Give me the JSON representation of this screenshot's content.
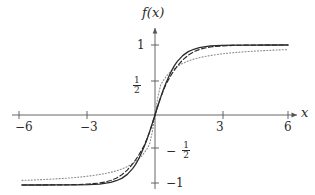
{
  "figure": {
    "kind": "math-function-plot",
    "background": "#ffffff",
    "ink_color": "#2b2b2b"
  },
  "labels": {
    "y_axis_name": "f(x)",
    "x_axis_name": "x",
    "x_ticks": [
      {
        "value": -6,
        "text": "−6"
      },
      {
        "value": -3,
        "text": "−3"
      },
      {
        "value": 3,
        "text": "3"
      },
      {
        "value": 6,
        "text": "6"
      }
    ],
    "y_ticks": [
      {
        "value": 1,
        "text": "1",
        "type": "integer"
      },
      {
        "value": 0.5,
        "text": "1/2",
        "type": "fraction",
        "num": "1",
        "den": "2",
        "sign": ""
      },
      {
        "value": -0.5,
        "text": "-1/2",
        "type": "fraction",
        "num": "1",
        "den": "2",
        "sign": "−"
      },
      {
        "value": -1,
        "text": "−1",
        "type": "integer"
      }
    ]
  },
  "chart_data": {
    "type": "line",
    "title": "",
    "subtitle": "",
    "xlabel": "x",
    "ylabel": "f(x)",
    "xlim": [
      -6.6,
      6.6
    ],
    "ylim": [
      -1.15,
      1.25
    ],
    "grid": false,
    "legend": "none",
    "axis_style": {
      "x_axis_at_y": 0,
      "y_axis_at_x": 0,
      "arrows": [
        "x-positive",
        "y-positive",
        "x-negative"
      ],
      "tick_marks": true
    },
    "x_tick_values": [
      -6,
      -3,
      3,
      6
    ],
    "y_tick_values": [
      -1,
      -0.5,
      0.5,
      1
    ],
    "annotations": [
      {
        "text": "f(x)",
        "x": 0,
        "y": 1.22,
        "role": "y-axis-name"
      },
      {
        "text": "x",
        "x": 6.55,
        "y": 0,
        "role": "x-axis-name"
      }
    ],
    "series": [
      {
        "name": "solid-steepest",
        "style": "solid",
        "color": "#2b2b2b",
        "width": 1.3,
        "formula": "tanh(2x)",
        "x": [
          -6,
          -5.5,
          -5,
          -4.5,
          -4,
          -3.5,
          -3,
          -2.5,
          -2,
          -1.75,
          -1.5,
          -1.25,
          -1,
          -0.875,
          -0.75,
          -0.625,
          -0.5,
          -0.375,
          -0.25,
          -0.125,
          0,
          0.125,
          0.25,
          0.375,
          0.5,
          0.625,
          0.75,
          0.875,
          1,
          1.25,
          1.5,
          1.75,
          2,
          2.5,
          3,
          3.5,
          4,
          4.5,
          5,
          5.5,
          6
        ],
        "y": [
          -1.0,
          -1.0,
          -1.0,
          -0.999,
          -0.999,
          -0.998,
          -0.995,
          -0.987,
          -0.964,
          -0.939,
          -0.905,
          -0.848,
          -0.762,
          -0.706,
          -0.635,
          -0.549,
          -0.462,
          -0.36,
          -0.245,
          -0.124,
          0.0,
          0.124,
          0.245,
          0.36,
          0.462,
          0.549,
          0.635,
          0.706,
          0.762,
          0.848,
          0.905,
          0.939,
          0.964,
          0.987,
          0.995,
          0.998,
          0.999,
          0.999,
          1.0,
          1.0,
          1.0
        ]
      },
      {
        "name": "dashed-medium",
        "style": "dashed",
        "color": "#2b2b2b",
        "width": 1.2,
        "formula": "tanh(1.45x)",
        "x": [
          -6,
          -5.5,
          -5,
          -4.5,
          -4,
          -3.5,
          -3,
          -2.5,
          -2.25,
          -2,
          -1.75,
          -1.5,
          -1.25,
          -1,
          -0.875,
          -0.75,
          -0.625,
          -0.5,
          -0.375,
          -0.25,
          -0.125,
          0,
          0.125,
          0.25,
          0.375,
          0.5,
          0.625,
          0.75,
          0.875,
          1,
          1.25,
          1.5,
          1.75,
          2,
          2.25,
          2.5,
          3,
          3.5,
          4,
          4.5,
          5,
          5.5,
          6
        ],
        "y": [
          -1.0,
          -1.0,
          -0.999,
          -0.999,
          -0.997,
          -0.994,
          -0.987,
          -0.972,
          -0.957,
          -0.936,
          -0.903,
          -0.855,
          -0.787,
          -0.696,
          -0.642,
          -0.582,
          -0.515,
          -0.442,
          -0.35,
          -0.248,
          -0.129,
          0.0,
          0.129,
          0.248,
          0.35,
          0.442,
          0.515,
          0.582,
          0.642,
          0.696,
          0.787,
          0.855,
          0.903,
          0.936,
          0.957,
          0.972,
          0.987,
          0.994,
          0.997,
          0.999,
          0.999,
          1.0,
          1.0
        ]
      },
      {
        "name": "dotted-gentlest",
        "style": "dotted",
        "color": "#8a8a8a",
        "width": 1.1,
        "formula": "(2/pi)*arctan(1.6x)",
        "x": [
          -6,
          -5.5,
          -5,
          -4.5,
          -4,
          -3.5,
          -3,
          -2.5,
          -2.25,
          -2,
          -1.75,
          -1.5,
          -1.25,
          -1,
          -0.875,
          -0.75,
          -0.625,
          -0.5,
          -0.375,
          -0.25,
          -0.125,
          0,
          0.125,
          0.25,
          0.375,
          0.5,
          0.625,
          0.75,
          0.875,
          1,
          1.25,
          1.5,
          1.75,
          2,
          2.25,
          2.5,
          3,
          3.5,
          4,
          4.5,
          5,
          5.5,
          6
        ],
        "y": [
          -0.934,
          -0.929,
          -0.921,
          -0.913,
          -0.903,
          -0.89,
          -0.873,
          -0.85,
          -0.836,
          -0.819,
          -0.798,
          -0.772,
          -0.738,
          -0.693,
          -0.665,
          -0.632,
          -0.594,
          -0.548,
          -0.492,
          -0.423,
          -0.249,
          0.0,
          0.249,
          0.423,
          0.492,
          0.548,
          0.594,
          0.632,
          0.665,
          0.693,
          0.738,
          0.772,
          0.798,
          0.819,
          0.836,
          0.85,
          0.873,
          0.89,
          0.903,
          0.913,
          0.921,
          0.929,
          0.934
        ]
      }
    ]
  }
}
